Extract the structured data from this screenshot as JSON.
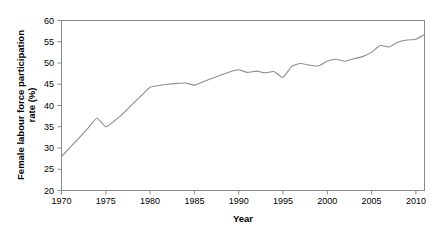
{
  "chart_data": {
    "type": "line",
    "title": "",
    "xlabel": "Year",
    "ylabel": "Female labour force participation rate (%)",
    "ylabel_line1": "Female labour force participation",
    "ylabel_line2": "rate (%)",
    "xlim": [
      1970,
      2011
    ],
    "ylim": [
      20,
      60
    ],
    "xticks": [
      1970,
      1975,
      1980,
      1985,
      1990,
      1995,
      2000,
      2005,
      2010
    ],
    "xtick_labels": [
      "1970",
      "1975",
      "1980",
      "1985",
      "1990",
      "1995",
      "2000",
      "2005",
      "2010"
    ],
    "yticks": [
      20,
      25,
      30,
      35,
      40,
      45,
      50,
      55,
      60
    ],
    "ytick_labels": [
      "20",
      "25",
      "30",
      "35",
      "40",
      "45",
      "50",
      "55",
      "60"
    ],
    "grid": false,
    "legend": false,
    "legend_position": "none",
    "line_color": "#8d8d8d",
    "series": [
      {
        "name": "Female labour force participation rate",
        "x": [
          1970,
          1971,
          1972,
          1973,
          1974,
          1975,
          1976,
          1977,
          1978,
          1979,
          1980,
          1981,
          1982,
          1983,
          1984,
          1985,
          1986,
          1987,
          1988,
          1989,
          1990,
          1991,
          1992,
          1993,
          1994,
          1995,
          1996,
          1997,
          1998,
          1999,
          2000,
          2001,
          2002,
          2003,
          2004,
          2005,
          2006,
          2007,
          2008,
          2009,
          2010,
          2011
        ],
        "values": [
          28.0,
          30.2,
          32.4,
          34.7,
          37.0,
          35.0,
          36.4,
          38.2,
          40.3,
          42.3,
          44.3,
          44.7,
          45.0,
          45.2,
          45.3,
          44.8,
          45.6,
          46.4,
          47.2,
          47.9,
          48.4,
          47.8,
          48.1,
          47.7,
          48.0,
          46.6,
          49.2,
          49.9,
          49.5,
          49.3,
          50.4,
          50.9,
          50.4,
          51.0,
          51.5,
          52.5,
          54.1,
          53.8,
          54.9,
          55.4,
          55.6,
          56.7
        ]
      }
    ]
  },
  "axes": {
    "x_title": "Year",
    "y_title_line1": "Female labour force participation",
    "y_title_line2": "rate (%)"
  }
}
